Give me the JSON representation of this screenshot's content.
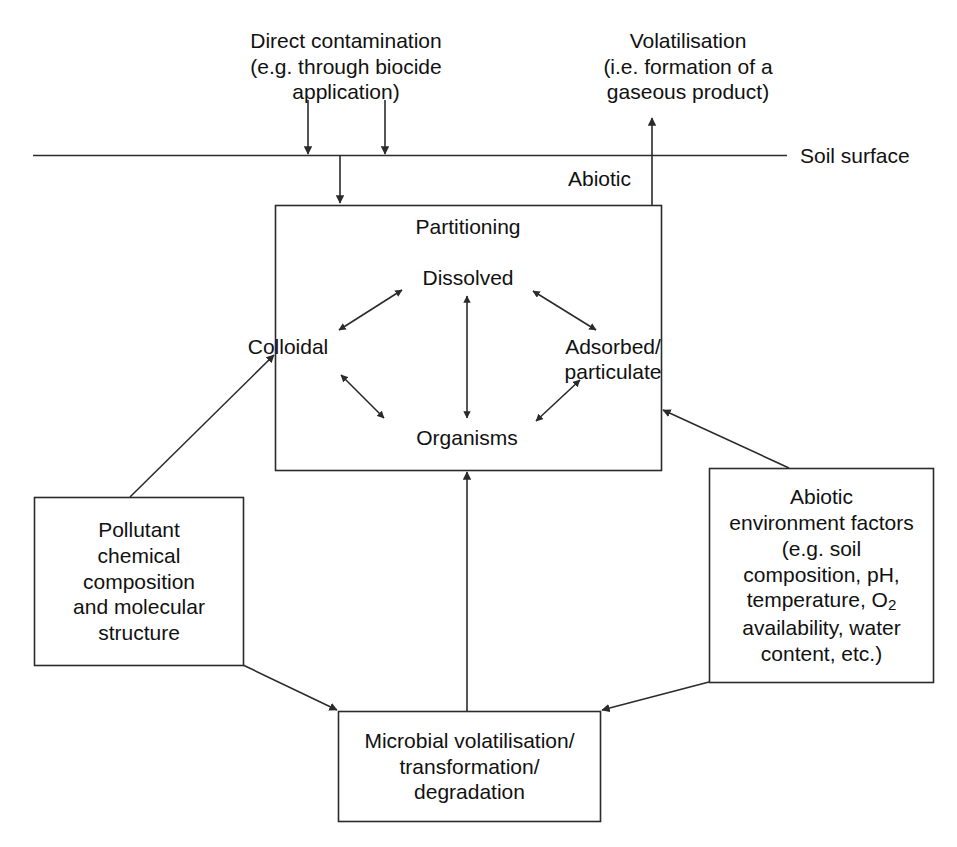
{
  "diagram": {
    "title_none": "",
    "soil_surface_label": "Soil surface",
    "abiotic_label": "Abiotic",
    "top_left_caption": "Direct contamination\n(e.g. through biocide\napplication)",
    "top_right_caption": "Volatilisation\n(i.e. formation of a\ngaseous product)",
    "partitioning": {
      "header": "Partitioning",
      "nodes": {
        "dissolved": "Dissolved",
        "colloidal": "Colloidal",
        "adsorbed": "Adsorbed/\nparticulate",
        "organisms": "Organisms"
      }
    },
    "pollutant_box": "Pollutant\nchemical\ncomposition\nand molecular\nstructure",
    "abiotic_factors_box_line1": "Abiotic",
    "abiotic_factors_box_line2": "environment factors",
    "abiotic_factors_box_line3": "(e.g. soil",
    "abiotic_factors_box_line4": "composition, pH,",
    "abiotic_factors_box_line5a": "temperature, O",
    "abiotic_factors_box_line5b": "2",
    "abiotic_factors_box_line6": "availability, water",
    "abiotic_factors_box_line7": "content, etc.)",
    "microbial_box": "Microbial volatilisation/\ntransformation/\ndegradation",
    "colors": {
      "stroke": "#2b2b2b",
      "text": "#111111",
      "background": "#ffffff"
    }
  }
}
